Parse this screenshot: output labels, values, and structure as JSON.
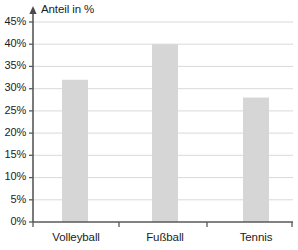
{
  "chart_data": {
    "type": "bar",
    "title": "",
    "subtitle": "",
    "xlabel": "",
    "ylabel": "Anteil in %",
    "categories": [
      "Volleyball",
      "Fußball",
      "Tennis"
    ],
    "values": [
      32,
      40,
      28
    ],
    "value_unit": "%",
    "ylim": [
      0,
      45
    ],
    "y_ticks": [
      0,
      5,
      10,
      15,
      20,
      25,
      30,
      35,
      40,
      45
    ],
    "y_tick_labels": [
      "0%",
      "5%",
      "10%",
      "15%",
      "20%",
      "25%",
      "30%",
      "35%",
      "40%",
      "45%"
    ],
    "grid": true,
    "grid_axis": "y",
    "legend": false,
    "legend_position": "none",
    "bar_color": "#d6d6d6",
    "axis_color": "#595959",
    "grid_color": "#d9d9d9",
    "text_color": "#1c1c1c",
    "y_axis_arrow": true,
    "annotations": []
  },
  "axis": {
    "y_title": "Anteil in %"
  }
}
